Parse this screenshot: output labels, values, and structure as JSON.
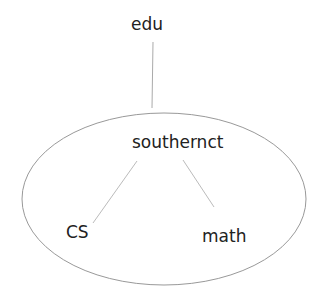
{
  "diagram": {
    "type": "domain-tree",
    "nodes": [
      {
        "id": "edu",
        "label": "edu"
      },
      {
        "id": "southernct",
        "label": "southernct"
      },
      {
        "id": "cs",
        "label": "CS"
      },
      {
        "id": "math",
        "label": "math"
      }
    ],
    "edges": [
      {
        "from": "edu",
        "to": "southernct"
      },
      {
        "from": "southernct",
        "to": "cs"
      },
      {
        "from": "southernct",
        "to": "math"
      }
    ],
    "grouping": {
      "shape": "ellipse",
      "contains": [
        "southernct",
        "cs",
        "math"
      ]
    },
    "colors": {
      "text": "#222222",
      "line": "#aaaaaa",
      "ellipse": "#999999"
    }
  }
}
